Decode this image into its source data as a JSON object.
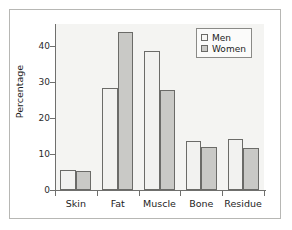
{
  "chart_data": {
    "type": "bar",
    "title": "",
    "subtitle": "",
    "xlabel": "",
    "ylabel": "Percentage",
    "categories": [
      "Skin",
      "Fat",
      "Muscle",
      "Bone",
      "Residue"
    ],
    "series": [
      {
        "name": "Men",
        "values": [
          5.5,
          28.3,
          38.6,
          13.6,
          14.1
        ],
        "color": "#f2f2f0"
      },
      {
        "name": "Women",
        "values": [
          5.2,
          43.7,
          27.8,
          12.0,
          11.6
        ],
        "color": "#c9c9c6"
      }
    ],
    "ylim": [
      0,
      46
    ],
    "yticks": [
      0,
      10,
      20,
      30,
      40
    ],
    "ytick_labels": [
      "0",
      "10",
      "20",
      "30",
      "40"
    ],
    "grid": false,
    "legend_position": "top-right",
    "legend_entries": [
      "Men",
      "Women"
    ]
  },
  "legend": {
    "men_label": "Men",
    "women_label": "Women"
  },
  "axes": {
    "y_title": "Percentage"
  }
}
